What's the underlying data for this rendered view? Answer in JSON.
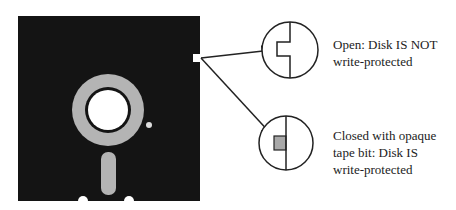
{
  "diagram": {
    "colors": {
      "disk": "#141414",
      "ring": "#b4b4b4",
      "tape": "#a8a8a8",
      "line": "#222222"
    },
    "callouts": [
      {
        "id": "open",
        "text_line1": "Open: Disk IS NOT",
        "text_line2": "write-protected"
      },
      {
        "id": "closed",
        "text_line1": "Closed with opaque",
        "text_line2": "tape bit: Disk IS",
        "text_line3": "write-protected"
      }
    ]
  }
}
